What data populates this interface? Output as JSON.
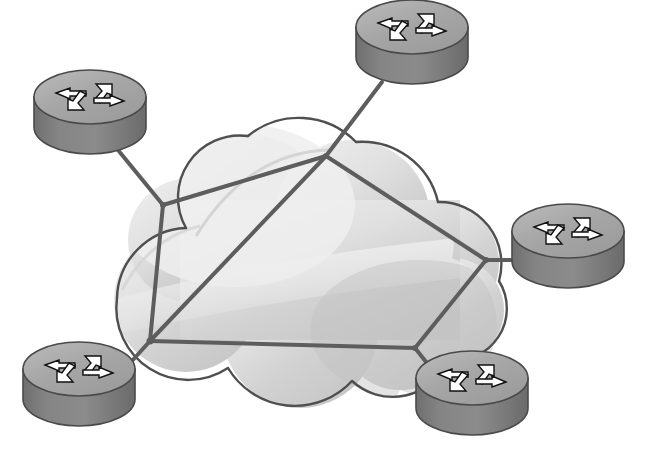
{
  "diagram": {
    "title": "Network cloud topology with five routers",
    "type": "network-topology",
    "background_color": "#ffffff",
    "canvas": {
      "width": 662,
      "height": 475
    }
  },
  "palette": {
    "link_stroke": "#5d5d5d",
    "cloud_outline": "#4f4f4f",
    "cloud_fill_light": "#e9e9e9",
    "cloud_fill_mid": "#d6d6d6",
    "cloud_fill_dark": "#c3c3c3",
    "cloud_highlight": "#f2f2f2",
    "router_top_face": "#a2a2a2",
    "router_top_light": "#b5b5b5",
    "router_side": "#7e7e7e",
    "router_side_dark": "#6d6d6d",
    "router_outline": "#4a4a4a",
    "arrow_fill": "#ffffff",
    "arrow_shadow": "#111111"
  },
  "cloud": {
    "name": "network-cloud",
    "label": "Network cloud",
    "center": {
      "x": 300,
      "y": 270
    },
    "lobes": [
      {
        "cx": 250,
        "cy": 215,
        "r": 80
      },
      {
        "cx": 352,
        "cy": 218,
        "r": 78
      },
      {
        "cx": 437,
        "cy": 263,
        "r": 62
      },
      {
        "cx": 452,
        "cy": 310,
        "r": 52
      },
      {
        "cx": 400,
        "cy": 330,
        "r": 60
      },
      {
        "cx": 300,
        "cy": 330,
        "r": 78
      },
      {
        "cx": 186,
        "cy": 300,
        "r": 72
      },
      {
        "cx": 190,
        "cy": 240,
        "r": 62
      }
    ]
  },
  "routers": [
    {
      "id": "router-top-left",
      "label": "Router top left",
      "cx": 90,
      "cy": 127,
      "rx": 56,
      "ry": 27,
      "depth": 30
    },
    {
      "id": "router-top",
      "label": "Router top",
      "cx": 412,
      "cy": 57,
      "rx": 56,
      "ry": 27,
      "depth": 30
    },
    {
      "id": "router-right",
      "label": "Router right",
      "cx": 568,
      "cy": 261,
      "rx": 56,
      "ry": 27,
      "depth": 30
    },
    {
      "id": "router-bottom-left",
      "label": "Router bottom left",
      "cx": 79,
      "cy": 399,
      "rx": 56,
      "ry": 27,
      "depth": 30
    },
    {
      "id": "router-bottom-right",
      "label": "Router bottom right",
      "cx": 472,
      "cy": 408,
      "rx": 56,
      "ry": 27,
      "depth": 30
    }
  ],
  "junctions": [
    {
      "id": "junction-nw",
      "label": "Cloud junction north west",
      "x": 163,
      "y": 205
    },
    {
      "id": "junction-n",
      "label": "Cloud junction north",
      "x": 326,
      "y": 156
    },
    {
      "id": "junction-e",
      "label": "Cloud junction east",
      "x": 486,
      "y": 260
    },
    {
      "id": "junction-sw",
      "label": "Cloud junction south west",
      "x": 150,
      "y": 341
    },
    {
      "id": "junction-s",
      "label": "Cloud junction south",
      "x": 415,
      "y": 348
    }
  ],
  "links": [
    {
      "id": "link-router-top-left-to-nw",
      "label": "Link top-left router to cloud",
      "x1": 118,
      "y1": 150,
      "x2": 163,
      "y2": 205,
      "width": 4
    },
    {
      "id": "link-router-top-to-n",
      "label": "Link top router to cloud",
      "x1": 382,
      "y1": 82,
      "x2": 326,
      "y2": 156,
      "width": 4
    },
    {
      "id": "link-router-right-to-e",
      "label": "Link right router to cloud",
      "x1": 513,
      "y1": 260,
      "x2": 486,
      "y2": 260,
      "width": 4
    },
    {
      "id": "link-router-bottom-left-to-sw",
      "label": "Link bottom-left router to cloud",
      "x1": 113,
      "y1": 382,
      "x2": 150,
      "y2": 341,
      "width": 4
    },
    {
      "id": "link-router-bottom-right-to-s",
      "label": "Link bottom-right router to cloud",
      "x1": 446,
      "y1": 387,
      "x2": 415,
      "y2": 348,
      "width": 4
    },
    {
      "id": "link-nw-to-n",
      "label": "Cloud link north-west to north",
      "x1": 163,
      "y1": 205,
      "x2": 326,
      "y2": 156,
      "width": 4
    },
    {
      "id": "link-nw-to-sw",
      "label": "Cloud link north-west to south-west",
      "x1": 163,
      "y1": 205,
      "x2": 150,
      "y2": 341,
      "width": 4
    },
    {
      "id": "link-n-to-sw",
      "label": "Cloud diagonal north to south-west",
      "x1": 326,
      "y1": 156,
      "x2": 150,
      "y2": 341,
      "width": 4
    },
    {
      "id": "link-n-to-e",
      "label": "Cloud link north to east",
      "x1": 326,
      "y1": 156,
      "x2": 486,
      "y2": 260,
      "width": 4
    },
    {
      "id": "link-e-to-s",
      "label": "Cloud link east to south",
      "x1": 486,
      "y1": 260,
      "x2": 415,
      "y2": 348,
      "width": 4
    },
    {
      "id": "link-sw-to-s",
      "label": "Cloud link south-west to south",
      "x1": 150,
      "y1": 341,
      "x2": 415,
      "y2": 348,
      "width": 4
    }
  ],
  "router_arrows": {
    "count": 4,
    "names": [
      "arrow-left",
      "arrow-up-right",
      "arrow-right",
      "arrow-down-left"
    ]
  }
}
